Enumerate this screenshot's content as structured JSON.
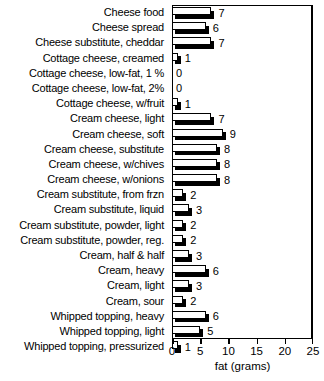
{
  "chart_data": {
    "type": "bar",
    "orientation": "horizontal",
    "title": "",
    "xlabel": "fat (grams)",
    "ylabel": "",
    "xlim": [
      0,
      25
    ],
    "xticks": [
      0,
      5,
      10,
      15,
      20,
      25
    ],
    "grid": false,
    "legend": null,
    "categories": [
      "Cheese food",
      "Cheese spread",
      "Cheese substitute, cheddar",
      "Cottage cheese, creamed",
      "Cottage cheese, low-fat, 1 %",
      "Cottage cheese, low-fat, 2%",
      "Cottage cheese, w/fruit",
      "Cream cheese, light",
      "Cream cheese, soft",
      "Cream cheese, substitute",
      "Cream cheese, w/chives",
      "Cream cheese, w/onions",
      "Cream substitute, from frzn",
      "Cream substitute, liquid",
      "Cream substitute, powder, light",
      "Cream substitute, powder, reg.",
      "Cream, half & half",
      "Cream, heavy",
      "Cream, light",
      "Cream, sour",
      "Whipped topping, heavy",
      "Whipped topping, light",
      "Whipped topping, pressurized"
    ],
    "values": [
      7,
      6,
      7,
      1,
      0,
      0,
      1,
      7,
      9,
      8,
      8,
      8,
      2,
      3,
      2,
      2,
      3,
      6,
      3,
      2,
      6,
      5,
      1
    ],
    "value_labels": [
      "7",
      "6",
      "7",
      "1",
      "0",
      "0",
      "1",
      "7",
      "9",
      "8",
      "8",
      "8",
      "2",
      "3",
      "2",
      "2",
      "3",
      "6",
      "3",
      "2",
      "6",
      "5",
      "1"
    ],
    "tick_labels": [
      "0",
      "5",
      "10",
      "15",
      "20",
      "25"
    ],
    "colors": {
      "bar_face": "#ffffff",
      "bar_outline": "#000000",
      "bar_shadow": "#000000",
      "axis": "#000000",
      "text": "#000000",
      "background": "#ffffff"
    }
  }
}
